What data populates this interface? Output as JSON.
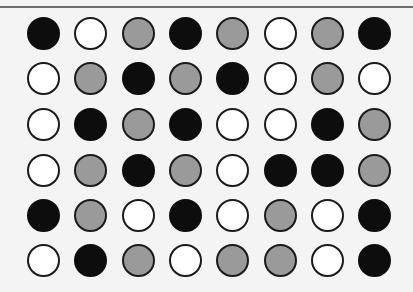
{
  "layout": {
    "col_centers": [
      43,
      90,
      138,
      185,
      232,
      280,
      327,
      374
    ],
    "row_centers": [
      33,
      78,
      124,
      170,
      215,
      260
    ],
    "radius": 16.5
  },
  "colors": {
    "black": "#0d0d0d",
    "white": "#ffffff",
    "gray": "#9a9a9a",
    "outline": "#1a1a1a",
    "background": "#f4f4f4",
    "top_line": "#6e6e6e"
  },
  "grid": [
    [
      "black",
      "white",
      "gray",
      "black",
      "gray",
      "white",
      "gray",
      "black"
    ],
    [
      "white",
      "gray",
      "black",
      "gray",
      "black",
      "white",
      "gray",
      "white"
    ],
    [
      "white",
      "black",
      "gray",
      "black",
      "white",
      "white",
      "black",
      "gray"
    ],
    [
      "white",
      "gray",
      "black",
      "gray",
      "white",
      "black",
      "black",
      "gray"
    ],
    [
      "black",
      "gray",
      "white",
      "black",
      "white",
      "gray",
      "white",
      "black"
    ],
    [
      "white",
      "black",
      "gray",
      "white",
      "gray",
      "gray",
      "white",
      "black"
    ]
  ]
}
